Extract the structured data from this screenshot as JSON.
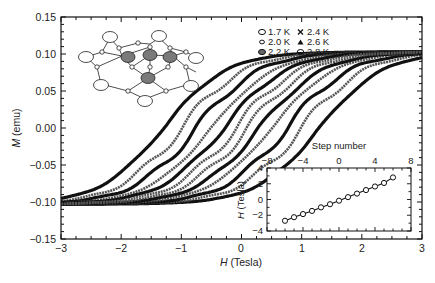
{
  "chart_data": [
    {
      "type": "line",
      "title": "",
      "xlabel": "H (Tesla)",
      "ylabel": "M (emu)",
      "xlim": [
        -3,
        3
      ],
      "ylim": [
        -0.15,
        0.15
      ],
      "xticks": [
        -3,
        -2,
        -1,
        0,
        1,
        2,
        3
      ],
      "xtick_labels": [
        "−3",
        "−2",
        "−1",
        "0",
        "1",
        "2",
        "3"
      ],
      "yticks": [
        -0.15,
        -0.1,
        -0.05,
        0.0,
        0.05,
        0.1,
        0.15
      ],
      "ytick_labels": [
        "−0.15",
        "−0.10",
        "−0.05",
        "0.00",
        "0.05",
        "0.10",
        "0.15"
      ],
      "grid": false,
      "legend_position": "upper right",
      "description": "Stepped magnetic hysteresis loops of M vs H at several temperatures; loops narrow with increasing temperature and show step-like features.",
      "series": [
        {
          "name": "1.7 K",
          "marker": "open-circle-large",
          "coercive_field": 1.3,
          "saturation": 0.105
        },
        {
          "name": "2.0 K",
          "marker": "open-circle-small",
          "coercive_field": 1.0,
          "saturation": 0.105
        },
        {
          "name": "2.2 K",
          "marker": "filled-circle",
          "coercive_field": 0.75,
          "saturation": 0.105
        },
        {
          "name": "2.4 K",
          "marker": "cross",
          "coercive_field": 0.5,
          "saturation": 0.105
        },
        {
          "name": "2.6 K",
          "marker": "filled-triangle",
          "coercive_field": 0.3,
          "saturation": 0.105
        },
        {
          "name": "2.8 K",
          "marker": "half-filled-circle",
          "coercive_field": 0.1,
          "saturation": 0.105
        }
      ],
      "annotations": [
        "Molecular structure inset (upper left): cluster of 4 gray metal atoms bridged by small atoms, with peripheral open-circle ligands"
      ]
    },
    {
      "type": "scatter",
      "title": "",
      "inset": true,
      "xlabel": "Step number",
      "ylabel": "H (Tesla)",
      "xlim": [
        -8,
        8
      ],
      "ylim": [
        -4,
        4
      ],
      "xticks": [
        -8,
        -4,
        0,
        4,
        8
      ],
      "xtick_labels": [
        "−8",
        "−4",
        "0",
        "4",
        "8"
      ],
      "yticks": [
        -4,
        -2,
        0,
        2,
        4
      ],
      "ytick_labels": [
        "−4",
        "−2",
        "0",
        "2",
        "4"
      ],
      "x_axis_position": "top",
      "grid": false,
      "x": [
        -6,
        -5,
        -4,
        -3,
        -2,
        -1,
        0,
        1,
        2,
        3,
        4,
        5,
        6
      ],
      "values": [
        -2.7,
        -2.25,
        -1.85,
        -1.45,
        -1.0,
        -0.6,
        -0.15,
        0.3,
        0.75,
        1.2,
        1.65,
        2.1,
        2.8
      ],
      "fit_line": true
    }
  ],
  "main_plot": {
    "xlabel_italic": "H",
    "xlabel_rest": " (Tesla)",
    "ylabel_italic": "M",
    "ylabel_rest": " (emu)",
    "xtick_labels": [
      "−3",
      "−2",
      "−1",
      "0",
      "1",
      "2",
      "3"
    ],
    "ytick_labels": [
      "0.15",
      "0.10",
      "0.05",
      "0.00",
      "−0.05",
      "−0.10",
      "−0.15"
    ]
  },
  "legend": {
    "items": [
      {
        "label": "1.7 K"
      },
      {
        "label": "2.0 K"
      },
      {
        "label": "2.2 K"
      },
      {
        "label": "2.4 K"
      },
      {
        "label": "2.6 K"
      },
      {
        "label": "2.8 K"
      }
    ]
  },
  "inset": {
    "xlabel": "Step number",
    "ylabel_italic": "H",
    "ylabel_rest": " (Tesla)",
    "xtick_labels": [
      "−8",
      "−4",
      "0",
      "4",
      "8"
    ],
    "ytick_labels": [
      "4",
      "2",
      "0",
      "−2",
      "−4"
    ]
  },
  "colors": {
    "ink": "#111111",
    "metal_atom": "#7a7a7a",
    "background": "#ffffff"
  }
}
